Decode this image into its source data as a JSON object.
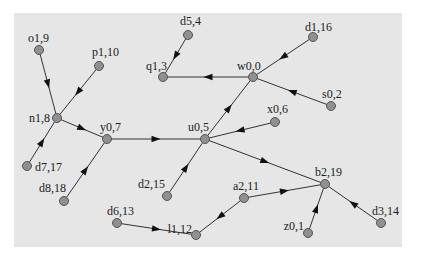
{
  "diagram": {
    "type": "directed-graph",
    "background": "#e6e6e6",
    "node_color": "#909090",
    "edge_color": "#333333",
    "nodes": [
      {
        "id": "o1,9",
        "label": "o1,9",
        "x": 39,
        "y": 50,
        "lx": 28,
        "ly": 42,
        "anchor": "start"
      },
      {
        "id": "p1,10",
        "label": "p1,10",
        "x": 99,
        "y": 66,
        "lx": 92,
        "ly": 56,
        "anchor": "start"
      },
      {
        "id": "n1,8",
        "label": "n1,8",
        "x": 57,
        "y": 118,
        "lx": 50,
        "ly": 122,
        "anchor": "end"
      },
      {
        "id": "d7,17",
        "label": "d7,17",
        "x": 27,
        "y": 166,
        "lx": 35,
        "ly": 171,
        "anchor": "start"
      },
      {
        "id": "y0,7",
        "label": "y0,7",
        "x": 107,
        "y": 139,
        "lx": 100,
        "ly": 131,
        "anchor": "start"
      },
      {
        "id": "d8,18",
        "label": "d8,18",
        "x": 64,
        "y": 201,
        "lx": 66,
        "ly": 192,
        "anchor": "end"
      },
      {
        "id": "d5,4",
        "label": "d5,4",
        "x": 188,
        "y": 35,
        "lx": 180,
        "ly": 25,
        "anchor": "start"
      },
      {
        "id": "q1,3",
        "label": "q1,3",
        "x": 163,
        "y": 77,
        "lx": 146,
        "ly": 70,
        "anchor": "start"
      },
      {
        "id": "w0,0",
        "label": "w0,0",
        "x": 253,
        "y": 77,
        "lx": 237,
        "ly": 70,
        "anchor": "start"
      },
      {
        "id": "d1,16",
        "label": "d1,16",
        "x": 313,
        "y": 37,
        "lx": 305,
        "ly": 31,
        "anchor": "start"
      },
      {
        "id": "s0,2",
        "label": "s0,2",
        "x": 331,
        "y": 106,
        "lx": 322,
        "ly": 98,
        "anchor": "start"
      },
      {
        "id": "x0,6",
        "label": "x0,6",
        "x": 275,
        "y": 122,
        "lx": 267,
        "ly": 113,
        "anchor": "start"
      },
      {
        "id": "u0,5",
        "label": "u0,5",
        "x": 205,
        "y": 139,
        "lx": 188,
        "ly": 131,
        "anchor": "start"
      },
      {
        "id": "d2,15",
        "label": "d2,15",
        "x": 167,
        "y": 196,
        "lx": 165,
        "ly": 188,
        "anchor": "end"
      },
      {
        "id": "b2,19",
        "label": "b2,19",
        "x": 325,
        "y": 184,
        "lx": 315,
        "ly": 176,
        "anchor": "start"
      },
      {
        "id": "a2,11",
        "label": "a2,11",
        "x": 244,
        "y": 198,
        "lx": 233,
        "ly": 190,
        "anchor": "start"
      },
      {
        "id": "d6,13",
        "label": "d6,13",
        "x": 117,
        "y": 223,
        "lx": 107,
        "ly": 215,
        "anchor": "start"
      },
      {
        "id": "l1,12",
        "label": "l1,12",
        "x": 196,
        "y": 235,
        "lx": 192,
        "ly": 233,
        "anchor": "end"
      },
      {
        "id": "z0,1",
        "label": "z0,1",
        "x": 308,
        "y": 233,
        "lx": 304,
        "ly": 230,
        "anchor": "end"
      },
      {
        "id": "d3,14",
        "label": "d3,14",
        "x": 381,
        "y": 223,
        "lx": 372,
        "ly": 215,
        "anchor": "start"
      }
    ],
    "edges": [
      {
        "from": "o1,9",
        "to": "n1,8"
      },
      {
        "from": "p1,10",
        "to": "n1,8"
      },
      {
        "from": "d7,17",
        "to": "n1,8"
      },
      {
        "from": "n1,8",
        "to": "y0,7"
      },
      {
        "from": "d8,18",
        "to": "y0,7"
      },
      {
        "from": "y0,7",
        "to": "u0,5"
      },
      {
        "from": "d2,15",
        "to": "u0,5"
      },
      {
        "from": "x0,6",
        "to": "u0,5"
      },
      {
        "from": "u0,5",
        "to": "w0,0"
      },
      {
        "from": "u0,5",
        "to": "b2,19"
      },
      {
        "from": "d1,16",
        "to": "w0,0"
      },
      {
        "from": "s0,2",
        "to": "w0,0"
      },
      {
        "from": "w0,0",
        "to": "q1,3"
      },
      {
        "from": "d5,4",
        "to": "q1,3"
      },
      {
        "from": "d6,13",
        "to": "l1,12"
      },
      {
        "from": "a2,11",
        "to": "l1,12"
      },
      {
        "from": "a2,11",
        "to": "b2,19"
      },
      {
        "from": "z0,1",
        "to": "b2,19"
      },
      {
        "from": "d3,14",
        "to": "b2,19"
      }
    ]
  }
}
